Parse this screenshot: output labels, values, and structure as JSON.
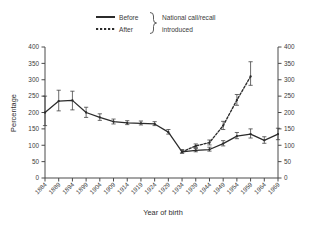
{
  "chart_data": {
    "type": "line",
    "title": "",
    "xlabel": "Year of birth",
    "ylabel": "Percentage",
    "ylim": [
      0,
      400
    ],
    "ytick_step": 50,
    "yticks": [
      0,
      50,
      100,
      150,
      200,
      250,
      300,
      350,
      400
    ],
    "right_axis": true,
    "right_yticks": [
      0,
      50,
      100,
      150,
      200,
      250,
      300,
      350,
      400
    ],
    "grid": false,
    "legend_position": "top-center",
    "categories": [
      "1884",
      "1889",
      "1894",
      "1899",
      "1904",
      "1909",
      "1914",
      "1919",
      "1924",
      "1929",
      "1934",
      "1939",
      "1944",
      "1949",
      "1954",
      "1959",
      "1964",
      "1969"
    ],
    "series": [
      {
        "name": "Before",
        "style": "solid",
        "x": [
          "1884",
          "1889",
          "1894",
          "1899",
          "1904",
          "1909",
          "1914",
          "1919",
          "1924",
          "1929",
          "1934",
          "1939",
          "1944",
          "1949",
          "1954",
          "1959",
          "1964",
          "1969"
        ],
        "values": [
          200,
          235,
          237,
          200,
          185,
          172,
          168,
          167,
          165,
          140,
          80,
          84,
          87,
          105,
          128,
          134,
          115,
          134
        ],
        "ci_low": [
          160,
          205,
          208,
          185,
          176,
          165,
          163,
          162,
          160,
          134,
          76,
          80,
          82,
          98,
          120,
          122,
          106,
          117
        ],
        "ci_high": [
          250,
          268,
          265,
          216,
          196,
          180,
          175,
          174,
          172,
          148,
          86,
          90,
          94,
          114,
          139,
          150,
          126,
          152
        ]
      },
      {
        "name": "After",
        "style": "dotted",
        "x": [
          "1934",
          "1939",
          "1944",
          "1949",
          "1954",
          "1959"
        ],
        "values": [
          80,
          98,
          108,
          160,
          238,
          310
        ],
        "ci_low": [
          76,
          93,
          101,
          148,
          222,
          283
        ],
        "ci_high": [
          86,
          104,
          116,
          173,
          255,
          355
        ]
      }
    ]
  },
  "legend": {
    "before_label": "Before",
    "after_label": "After",
    "note_line1": "National call/recall",
    "note_line2": "introduced"
  },
  "axes": {
    "y_title": "Percentage",
    "x_title": "Year of birth"
  }
}
